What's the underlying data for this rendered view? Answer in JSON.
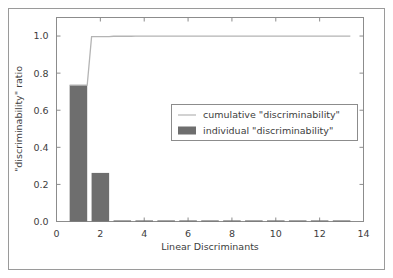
{
  "chart_data": {
    "type": "bar",
    "title": "",
    "xlabel": "Linear Discriminants",
    "ylabel": "\"discriminability\" ratio",
    "xlim": [
      0,
      14
    ],
    "ylim": [
      0.0,
      1.1
    ],
    "grid": false,
    "legend_position": "center-right",
    "x_ticks": [
      0,
      2,
      4,
      6,
      8,
      10,
      12,
      14
    ],
    "x_tick_labels": [
      "0",
      "2",
      "4",
      "6",
      "8",
      "10",
      "12",
      "14"
    ],
    "y_ticks": [
      0.0,
      0.2,
      0.4,
      0.6,
      0.8,
      1.0
    ],
    "y_tick_labels": [
      "0.0",
      "0.2",
      "0.4",
      "0.6",
      "0.8",
      "1.0"
    ],
    "categories": [
      1,
      2,
      3,
      4,
      5,
      6,
      7,
      8,
      9,
      10,
      11,
      12,
      13
    ],
    "series": [
      {
        "name": "individual \"discriminability\"",
        "type": "bar",
        "color": "#6e6e6e",
        "values": [
          0.735,
          0.262,
          0.002,
          0.002,
          0.001,
          0.001,
          0.001,
          0.001,
          0.001,
          0.001,
          0.001,
          0.001,
          0.001
        ]
      },
      {
        "name": "cumulative \"discriminability\"",
        "type": "step",
        "color": "#b4b4b4",
        "values": [
          0.735,
          0.997,
          0.999,
          1.0,
          1.0,
          1.0,
          1.0,
          1.0,
          1.0,
          1.0,
          1.0,
          1.0,
          1.0
        ]
      }
    ]
  },
  "legend": {
    "items": [
      {
        "label": "cumulative \"discriminability\"",
        "marker": "line",
        "color": "#b4b4b4"
      },
      {
        "label": "individual \"discriminability\"",
        "marker": "patch",
        "color": "#6e6e6e"
      }
    ]
  },
  "axes": {
    "x_title": "Linear Discriminants",
    "y_title": "\"discriminability\" ratio"
  },
  "colors": {
    "bar": "#6e6e6e",
    "line": "#b4b4b4",
    "frame": "#8c8c8c",
    "outer_border": "#9a9a9a",
    "text": "#3d3d3d",
    "background": "#ffffff"
  }
}
